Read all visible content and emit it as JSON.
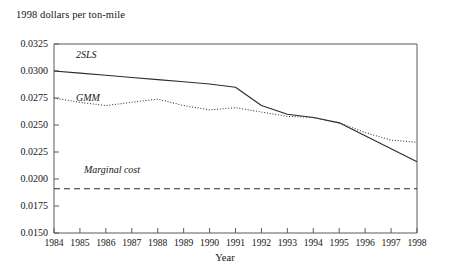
{
  "chart_data": {
    "type": "line",
    "title": "1998 dollars per ton-mile",
    "xlabel": "Year",
    "ylabel": "1998 dollars per ton-mile",
    "grid": false,
    "legend_position": "inline-annotations",
    "xlim": [
      1984,
      1998
    ],
    "ylim": [
      0.015,
      0.0325
    ],
    "ytick_step": 0.0025,
    "categories": [
      1984,
      1985,
      1986,
      1987,
      1988,
      1989,
      1990,
      1991,
      1992,
      1993,
      1994,
      1995,
      1996,
      1997,
      1998
    ],
    "xtick_labels": [
      "1984",
      "1985",
      "1986",
      "1987",
      "1988",
      "1989",
      "1990",
      "1991",
      "1992",
      "1993",
      "1994",
      "1995",
      "1996",
      "1997",
      "1998"
    ],
    "ytick_labels": [
      "0.0150",
      "0.0175",
      "0.0200",
      "0.0225",
      "0.0250",
      "0.0275",
      "0.0300",
      "0.0325"
    ],
    "ytick_values": [
      0.015,
      0.0175,
      0.02,
      0.0225,
      0.025,
      0.0275,
      0.03,
      0.0325
    ],
    "series": [
      {
        "name": "2SLS",
        "style": "solid",
        "color": "#2b2b2b",
        "values": [
          0.03,
          0.0298,
          0.0296,
          0.0294,
          0.0292,
          0.029,
          0.0288,
          0.0285,
          0.0268,
          0.026,
          0.0257,
          0.0252,
          0.024,
          0.0228,
          0.0216
        ]
      },
      {
        "name": "GMM",
        "style": "dotted",
        "color": "#3a3a3a",
        "values": [
          0.0275,
          0.0271,
          0.0268,
          0.0271,
          0.0274,
          0.0268,
          0.0264,
          0.0266,
          0.0262,
          0.0258,
          0.0257,
          0.0252,
          0.0243,
          0.0236,
          0.0234
        ]
      },
      {
        "name": "Marginal cost",
        "style": "dashed",
        "color": "#2b2b2b",
        "values": [
          0.0191,
          0.0191,
          0.0191,
          0.0191,
          0.0191,
          0.0191,
          0.0191,
          0.0191,
          0.0191,
          0.0191,
          0.0191,
          0.0191,
          0.0191,
          0.0191,
          0.0191
        ]
      }
    ],
    "annotations": [
      {
        "text": "2SLS",
        "series": "2SLS"
      },
      {
        "text": "GMM",
        "series": "GMM"
      },
      {
        "text": "Marginal cost",
        "series": "Marginal cost"
      }
    ]
  },
  "axis_colors": {
    "frame": "#5a5a5a",
    "text": "#151515"
  }
}
